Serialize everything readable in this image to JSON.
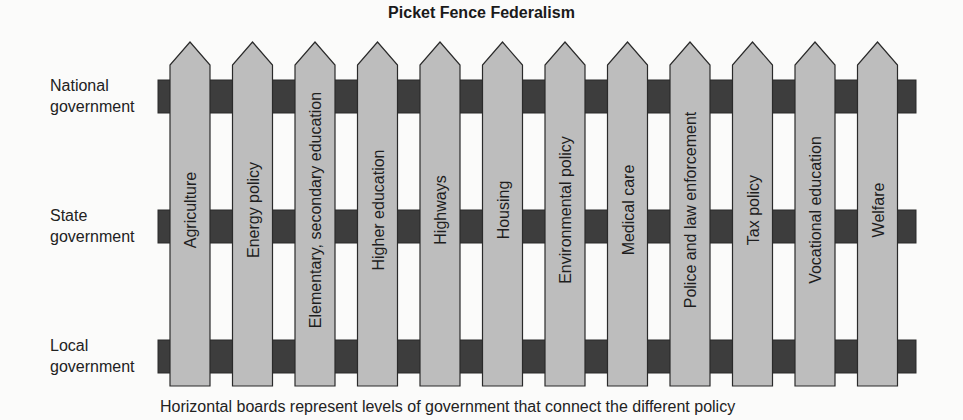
{
  "diagram": {
    "title": "Picket Fence Federalism",
    "levels": [
      {
        "label_line1": "National",
        "label_line2": "government"
      },
      {
        "label_line1": "State",
        "label_line2": "government"
      },
      {
        "label_line1": "Local",
        "label_line2": "government"
      }
    ],
    "policies": [
      "Agriculture",
      "Energy policy",
      "Elementary, secondary education",
      "Higher education",
      "Highways",
      "Housing",
      "Environmental policy",
      "Medical care",
      "Police and law enforcement",
      "Tax policy",
      "Vocational education",
      "Welfare"
    ],
    "caption": "Horizontal boards represent levels of government that connect the different policy",
    "colors": {
      "board": "#3d3d3d",
      "picket": "#bdbdbd",
      "outline": "#2a2a2a"
    }
  }
}
